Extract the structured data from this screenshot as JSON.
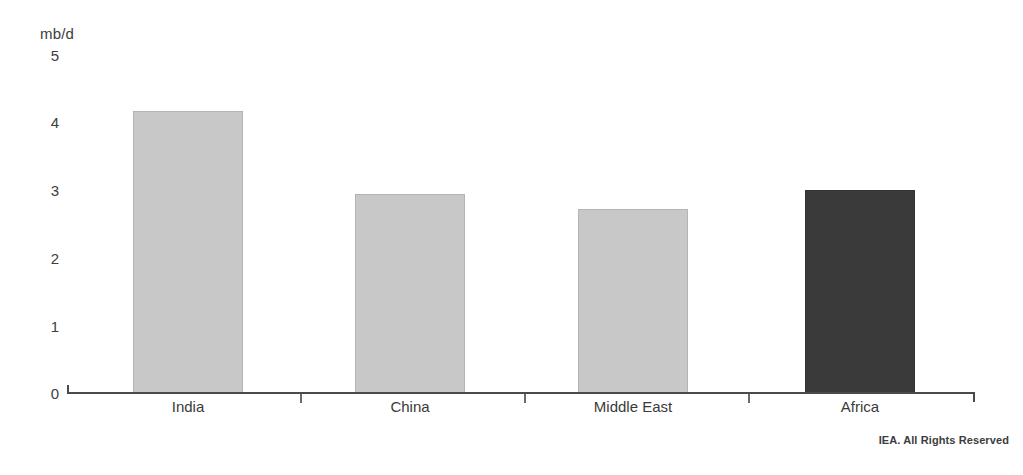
{
  "chart_data": {
    "type": "bar",
    "title": "",
    "subtitle": "",
    "xlabel": "",
    "ylabel": "mb/d",
    "categories": [
      "India",
      "China",
      "Middle East",
      "Africa"
    ],
    "values": [
      4.28,
      3.01,
      2.79,
      3.08
    ],
    "ylim": [
      0,
      5
    ],
    "yticks": [
      0,
      1,
      2,
      3,
      4,
      5
    ],
    "ytick_labels": [
      "0",
      "1",
      "2",
      "3",
      "4",
      "5"
    ],
    "grid": false,
    "legend": null,
    "legend_position": "none",
    "series": [
      {
        "name": "Oil demand growth",
        "values": [
          4.28,
          3.01,
          2.79,
          3.08
        ],
        "colors": [
          "#c8c8c8",
          "#c8c8c8",
          "#c8c8c8",
          "#3a3a3a"
        ]
      }
    ],
    "annotations": []
  },
  "axis": {
    "unit_label": "mb/d",
    "tick_0": "0",
    "tick_1": "1",
    "tick_2": "2",
    "tick_3": "3",
    "tick_4": "4",
    "tick_5": "5"
  },
  "categories": {
    "india": "India",
    "china": "China",
    "middle_east": "Middle East",
    "africa": "Africa"
  },
  "footer": {
    "credit": "IEA. All Rights Reserved"
  },
  "colors": {
    "bar_light": "#c8c8c8",
    "bar_dark": "#3a3a3a",
    "axis": "#4a4a4a",
    "text": "#3a3a3a",
    "background": "#ffffff"
  }
}
